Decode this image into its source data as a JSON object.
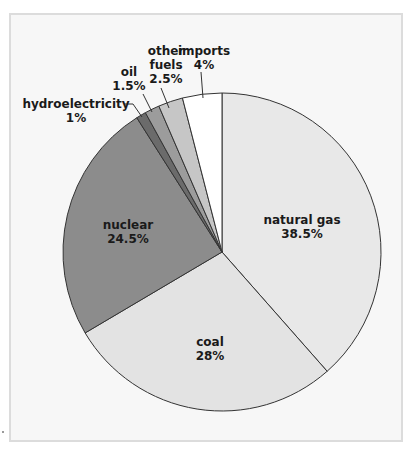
{
  "chart_data": {
    "type": "pie",
    "title": "",
    "start_angle_deg": 0,
    "direction": "clockwise",
    "center": [
      222,
      252
    ],
    "radius": 159,
    "slices": [
      {
        "label": "natural gas",
        "value": 38.5,
        "value_label": "38.5%",
        "color": "#e8e8e8"
      },
      {
        "label": "coal",
        "value": 28,
        "value_label": "28%",
        "color": "#e3e3e3"
      },
      {
        "label": "nuclear",
        "value": 24.5,
        "value_label": "24.5%",
        "color": "#8c8c8c"
      },
      {
        "label": "hydroelectricity",
        "value": 1,
        "value_label": "1%",
        "color": "#6b6b6b"
      },
      {
        "label": "oil",
        "value": 1.5,
        "value_label": "1.5%",
        "color": "#9c9c9c"
      },
      {
        "label": "other fuels",
        "value": 2.5,
        "value_label": "2.5%",
        "color": "#c6c6c6"
      },
      {
        "label": "imports",
        "value": 4,
        "value_label": "4%",
        "color": "#ffffff"
      }
    ],
    "categories": [
      "natural gas",
      "coal",
      "nuclear",
      "hydroelectricity",
      "oil",
      "other fuels",
      "imports"
    ],
    "values": [
      38.5,
      28,
      24.5,
      1,
      1.5,
      2.5,
      4
    ],
    "legend": "none (inline labels)",
    "edge_color": "#333333"
  },
  "labels": {
    "natural_gas": {
      "name": "natural gas",
      "value": "38.5%"
    },
    "coal": {
      "name": "coal",
      "value": "28%"
    },
    "nuclear": {
      "name": "nuclear",
      "value": "24.5%"
    },
    "hydroelectricity": {
      "name": "hydroelectricity",
      "value": "1%"
    },
    "oil": {
      "name": "oil",
      "value": "1.5%"
    },
    "other_fuels": {
      "name_line1": "other",
      "name_line2": "fuels",
      "value": "2.5%"
    },
    "imports": {
      "name": "imports",
      "value": "4%"
    }
  }
}
